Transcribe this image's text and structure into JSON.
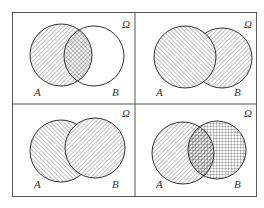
{
  "figure": {
    "universe_label": "Ω",
    "set_a_label": "A",
    "set_b_label": "B",
    "colors": {
      "frame": "#555555",
      "stroke": "#333333",
      "hatch": "#444444"
    },
    "panels": [
      {
        "position": "top-left",
        "description": "A shaded (hatched), B unshaded; intersection cross-hatched"
      },
      {
        "position": "top-right",
        "description": "A ∪ B shaded; A on top with dense hatch, B with diagonal hatch"
      },
      {
        "position": "bottom-left",
        "description": "A ∪ B shaded; B on top with diagonal hatch, A with opposite hatch"
      },
      {
        "position": "bottom-right",
        "description": "A hatched, B grid-hatched; intersection shows both patterns"
      }
    ]
  }
}
